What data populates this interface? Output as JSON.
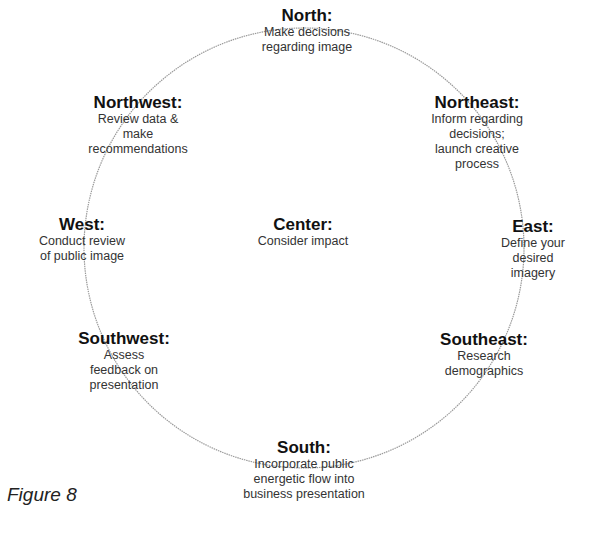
{
  "diagram": {
    "ring_color": "#9a9a9a",
    "nodes": [
      {
        "id": "north",
        "title": "North:",
        "desc": "Make decisions\nregarding image"
      },
      {
        "id": "northwest",
        "title": "Northwest:",
        "desc": "Review data &\nmake\nrecommendations"
      },
      {
        "id": "northeast",
        "title": "Northeast:",
        "desc": "Inform regarding\ndecisions;\nlaunch creative\nprocess"
      },
      {
        "id": "west",
        "title": "West:",
        "desc": "Conduct review\nof public image"
      },
      {
        "id": "center",
        "title": "Center:",
        "desc": "Consider impact"
      },
      {
        "id": "east",
        "title": "East:",
        "desc": "Define your\ndesired imagery"
      },
      {
        "id": "southwest",
        "title": "Southwest:",
        "desc": "Assess\nfeedback on\npresentation"
      },
      {
        "id": "southeast",
        "title": "Southeast:",
        "desc": "Research\ndemographics"
      },
      {
        "id": "south",
        "title": "South:",
        "desc": "Incorporate public\nenergetic flow into\nbusiness presentation"
      }
    ]
  },
  "caption": "Figure 8"
}
